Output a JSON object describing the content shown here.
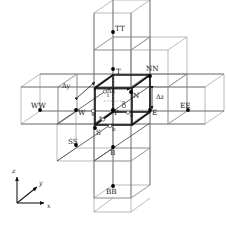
{
  "figure": {
    "colors": {
      "outer_grid": "#9a9a9a",
      "mid_grid": "#5f5f5f",
      "control_volume": "#111111",
      "node_fill": "#000000",
      "face_stroke": "#3a3a3a",
      "background": "#ffffff"
    }
  },
  "nodes": [
    {
      "id": "TT",
      "label": "TT",
      "type": "far-neighbour",
      "x": 113,
      "y": 32,
      "lx": 115,
      "ly": 31,
      "anchor": "start"
    },
    {
      "id": "T",
      "label": "T",
      "type": "neighbour",
      "x": 113,
      "y": 69,
      "lx": 116,
      "ly": 74,
      "anchor": "start"
    },
    {
      "id": "NN",
      "label": "NN",
      "type": "far-neighbour",
      "x": 150,
      "y": 76,
      "lx": 146,
      "ly": 71,
      "anchor": "start"
    },
    {
      "id": "N",
      "label": "N",
      "type": "neighbour",
      "x": 131,
      "y": 92,
      "lx": 133,
      "ly": 98,
      "anchor": "start"
    },
    {
      "id": "WW",
      "label": "WW",
      "type": "far-neighbour",
      "x": 40,
      "y": 110,
      "lx": 33,
      "ly": 108,
      "anchor": "start"
    },
    {
      "id": "W",
      "label": "W",
      "type": "neighbour",
      "x": 76,
      "y": 110,
      "lx": 78,
      "ly": 115,
      "anchor": "start"
    },
    {
      "id": "P",
      "label": "P",
      "type": "centre",
      "x": 113,
      "y": 110,
      "lx": 115,
      "ly": 115,
      "anchor": "start"
    },
    {
      "id": "E",
      "label": "E",
      "type": "neighbour",
      "x": 150,
      "y": 110,
      "lx": 152,
      "ly": 115,
      "anchor": "start"
    },
    {
      "id": "EE",
      "label": "EE",
      "type": "far-neighbour",
      "x": 188,
      "y": 110,
      "lx": 181,
      "ly": 108,
      "anchor": "start"
    },
    {
      "id": "S",
      "label": "S",
      "type": "neighbour",
      "x": 95,
      "y": 128,
      "lx": 97,
      "ly": 134,
      "anchor": "start"
    },
    {
      "id": "SS",
      "label": "SS",
      "type": "far-neighbour",
      "x": 76,
      "y": 145,
      "lx": 70,
      "ly": 143,
      "anchor": "start"
    },
    {
      "id": "B",
      "label": "B",
      "type": "neighbour",
      "x": 113,
      "y": 147,
      "lx": 110,
      "ly": 154,
      "anchor": "start"
    },
    {
      "id": "BB",
      "label": "BB",
      "type": "far-neighbour",
      "x": 113,
      "y": 186,
      "lx": 107,
      "ly": 193,
      "anchor": "start"
    }
  ],
  "faces": [
    {
      "id": "t",
      "label": "t",
      "x": 109,
      "y": 91,
      "lx": 111,
      "ly": 96,
      "anchor": "start"
    },
    {
      "id": "n",
      "label": "n",
      "x": 123,
      "y": 104,
      "lx": 125,
      "ly": 104,
      "anchor": "start"
    },
    {
      "id": "e",
      "label": "e",
      "x": 129,
      "y": 112,
      "lx": 131,
      "ly": 115,
      "anchor": "start"
    },
    {
      "id": "w",
      "label": "w",
      "x": 95,
      "y": 112,
      "lx": 97,
      "ly": 116,
      "anchor": "start"
    },
    {
      "id": "s",
      "label": "s",
      "x": 102,
      "y": 120,
      "lx": 99,
      "ly": 120,
      "anchor": "start"
    },
    {
      "id": "b",
      "label": "b",
      "x": 110,
      "y": 128,
      "lx": 112,
      "ly": 131,
      "anchor": "start"
    }
  ],
  "dimensions": [
    {
      "id": "dx",
      "label": "Δx",
      "lx": 108,
      "ly": 92,
      "anchor": "start",
      "arrow": {
        "x1": 95,
        "y1": 88,
        "x2": 132,
        "y2": 88
      }
    },
    {
      "id": "dy",
      "label": "Δy",
      "lx": 62,
      "ly": 88,
      "anchor": "start",
      "arrow": {
        "x1": 78,
        "y1": 97,
        "x2": 96,
        "y2": 80
      }
    },
    {
      "id": "dz",
      "label": "Δz",
      "lx": 157,
      "ly": 97,
      "anchor": "start",
      "arrow": {
        "x1": 152,
        "y1": 88,
        "x2": 152,
        "y2": 110
      }
    }
  ],
  "axes": {
    "origin": {
      "x": 17,
      "y": 203
    },
    "items": [
      {
        "id": "z",
        "label": "z",
        "x2": 17,
        "y2": 176,
        "lx": 13,
        "ly": 172
      },
      {
        "id": "y",
        "label": "y",
        "x2": 38,
        "y2": 186,
        "lx": 40,
        "ly": 184
      },
      {
        "id": "x",
        "label": "x",
        "x2": 45,
        "y2": 203,
        "lx": 47,
        "ly": 207
      }
    ]
  }
}
